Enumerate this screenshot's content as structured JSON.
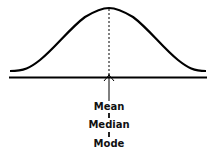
{
  "diagram": {
    "labels": [
      "Mean",
      "Median",
      "Mode"
    ],
    "separator": "|",
    "colors": {
      "stroke": "#000000",
      "background": "#ffffff"
    }
  }
}
